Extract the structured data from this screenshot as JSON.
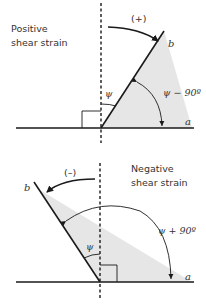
{
  "colors": {
    "line": "#1a1a1a",
    "shade": "#e6e6e6",
    "text": "#333333"
  },
  "top_panel": {
    "title_line1": "Positive",
    "title_line2": "shear strain",
    "sign_label": "(+)",
    "line_b_label": "b",
    "line_a_label": "a",
    "psi_label": "ψ",
    "angle_label": "ψ − 90º"
  },
  "bottom_panel": {
    "title_line1": "Negative",
    "title_line2": "shear strain",
    "sign_label": "(–)",
    "line_b_label": "b",
    "line_a_label": "a",
    "psi_label": "ψ",
    "angle_label": "ψ + 90º"
  }
}
